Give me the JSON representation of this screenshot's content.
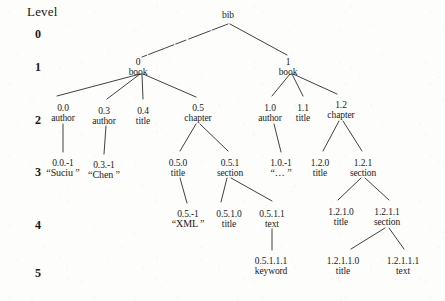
{
  "figure": {
    "level_axis_title": "Level",
    "level_numbers": [
      "0",
      "1",
      "2",
      "3",
      "4",
      "5"
    ]
  },
  "nodes": [
    {
      "key": "bib",
      "id": "",
      "label": "bib",
      "level": 0,
      "x": 228,
      "y": 10
    },
    {
      "key": "0",
      "id": "0",
      "label": "book",
      "level": 1,
      "x": 138,
      "y": 57
    },
    {
      "key": "1",
      "id": "1",
      "label": "book",
      "level": 1,
      "x": 288,
      "y": 57
    },
    {
      "key": "0.0",
      "id": "0.0",
      "label": "author",
      "level": 2,
      "x": 63,
      "y": 103
    },
    {
      "key": "0.3",
      "id": "0.3",
      "label": "author",
      "level": 2,
      "x": 104,
      "y": 106
    },
    {
      "key": "0.4",
      "id": "0.4",
      "label": "title",
      "level": 2,
      "x": 143,
      "y": 106
    },
    {
      "key": "0.5",
      "id": "0.5",
      "label": "chapter",
      "level": 2,
      "x": 198,
      "y": 103
    },
    {
      "key": "1.0",
      "id": "1.0",
      "label": "author",
      "level": 2,
      "x": 270,
      "y": 103
    },
    {
      "key": "1.1",
      "id": "1.1",
      "label": "title",
      "level": 2,
      "x": 303,
      "y": 103
    },
    {
      "key": "1.2",
      "id": "1.2",
      "label": "chapter",
      "level": 2,
      "x": 341,
      "y": 100
    },
    {
      "key": "0.0.-1",
      "id": "0.0.-1",
      "label": "“Suciu ”",
      "level": 3,
      "x": 63,
      "y": 158
    },
    {
      "key": "0.3.-1",
      "id": "0.3.-1",
      "label": "“Chen ”",
      "level": 3,
      "x": 104,
      "y": 160
    },
    {
      "key": "0.5.0",
      "id": "0.5.0",
      "label": "title",
      "level": 3,
      "x": 178,
      "y": 158
    },
    {
      "key": "0.5.1",
      "id": "0.5.1",
      "label": "section",
      "level": 3,
      "x": 230,
      "y": 158
    },
    {
      "key": "1.0.-1",
      "id": "1.0.-1",
      "label": "“… ”",
      "level": 3,
      "x": 281,
      "y": 158
    },
    {
      "key": "1.2.0",
      "id": "1.2.0",
      "label": "title",
      "level": 3,
      "x": 320,
      "y": 158
    },
    {
      "key": "1.2.1",
      "id": "1.2.1",
      "label": "section",
      "level": 3,
      "x": 363,
      "y": 158
    },
    {
      "key": "0.5.-1",
      "id": "0.5.-1",
      "label": "“XML ”",
      "level": 4,
      "x": 188,
      "y": 209
    },
    {
      "key": "0.5.1.0",
      "id": "0.5.1.0",
      "label": "title",
      "level": 4,
      "x": 229,
      "y": 209
    },
    {
      "key": "0.5.1.1",
      "id": "0.5.1.1",
      "label": "text",
      "level": 4,
      "x": 272,
      "y": 209
    },
    {
      "key": "1.2.1.0",
      "id": "1.2.1.0",
      "label": "title",
      "level": 4,
      "x": 341,
      "y": 207
    },
    {
      "key": "1.2.1.1",
      "id": "1.2.1.1",
      "label": "section",
      "level": 4,
      "x": 387,
      "y": 207
    },
    {
      "key": "0.5.1.1.1",
      "id": "0.5.1.1.1",
      "label": "keyword",
      "level": 5,
      "x": 271,
      "y": 256
    },
    {
      "key": "1.2.1.1.0",
      "id": "1.2.1.1.0",
      "label": "title",
      "level": 5,
      "x": 343,
      "y": 256
    },
    {
      "key": "1.2.1.1.1",
      "id": "1.2.1.1.1",
      "label": "text",
      "level": 5,
      "x": 403,
      "y": 256
    }
  ],
  "edges": [
    {
      "from": "bib",
      "to": "0",
      "x1": 228,
      "y1": 24,
      "x2": 142,
      "y2": 57,
      "style": "broken"
    },
    {
      "from": "bib",
      "to": "1",
      "x1": 230,
      "y1": 24,
      "x2": 287,
      "y2": 55,
      "style": "solid"
    },
    {
      "from": "0",
      "to": "0.0",
      "x1": 140,
      "y1": 74,
      "x2": 57,
      "y2": 96,
      "style": "solid"
    },
    {
      "from": "0",
      "to": "0.3",
      "x1": 140,
      "y1": 74,
      "x2": 107,
      "y2": 99,
      "style": "solid"
    },
    {
      "from": "0",
      "to": "0.4",
      "x1": 142,
      "y1": 74,
      "x2": 143,
      "y2": 99,
      "style": "solid"
    },
    {
      "from": "0",
      "to": "0.5",
      "x1": 143,
      "y1": 74,
      "x2": 196,
      "y2": 97,
      "style": "solid"
    },
    {
      "from": "1",
      "to": "1.0",
      "x1": 290,
      "y1": 74,
      "x2": 272,
      "y2": 96,
      "style": "solid"
    },
    {
      "from": "1",
      "to": "1.1",
      "x1": 292,
      "y1": 74,
      "x2": 303,
      "y2": 96,
      "style": "solid"
    },
    {
      "from": "1",
      "to": "1.2",
      "x1": 293,
      "y1": 74,
      "x2": 337,
      "y2": 94,
      "style": "solid"
    },
    {
      "from": "0.0",
      "to": "0.0.-1",
      "x1": 63,
      "y1": 124,
      "x2": 63,
      "y2": 152,
      "style": "solid"
    },
    {
      "from": "0.3",
      "to": "0.3.-1",
      "x1": 106,
      "y1": 126,
      "x2": 104,
      "y2": 154,
      "style": "solid"
    },
    {
      "from": "0.5",
      "to": "0.5.0",
      "x1": 196,
      "y1": 124,
      "x2": 180,
      "y2": 151,
      "style": "solid"
    },
    {
      "from": "0.5",
      "to": "0.5.1",
      "x1": 200,
      "y1": 124,
      "x2": 228,
      "y2": 151,
      "style": "solid"
    },
    {
      "from": "1.0",
      "to": "1.0.-1",
      "x1": 274,
      "y1": 124,
      "x2": 281,
      "y2": 152,
      "style": "solid"
    },
    {
      "from": "1.2",
      "to": "1.2.0",
      "x1": 339,
      "y1": 121,
      "x2": 323,
      "y2": 151,
      "style": "solid"
    },
    {
      "from": "1.2",
      "to": "1.2.1",
      "x1": 343,
      "y1": 121,
      "x2": 362,
      "y2": 151,
      "style": "solid"
    },
    {
      "from": "0.5.0",
      "to": "0.5.-1",
      "x1": 180,
      "y1": 178,
      "x2": 187,
      "y2": 203,
      "style": "solid"
    },
    {
      "from": "0.5.1",
      "to": "0.5.1.0",
      "x1": 227,
      "y1": 178,
      "x2": 221,
      "y2": 202,
      "style": "solid"
    },
    {
      "from": "0.5.1",
      "to": "0.5.1.1",
      "x1": 231,
      "y1": 178,
      "x2": 272,
      "y2": 201,
      "style": "solid"
    },
    {
      "from": "1.2.1",
      "to": "1.2.1.0",
      "x1": 361,
      "y1": 178,
      "x2": 338,
      "y2": 200,
      "style": "solid"
    },
    {
      "from": "1.2.1",
      "to": "1.2.1.1",
      "x1": 365,
      "y1": 178,
      "x2": 389,
      "y2": 200,
      "style": "solid"
    },
    {
      "from": "0.5.1.1",
      "to": "0.5.1.1.1",
      "x1": 272,
      "y1": 229,
      "x2": 272,
      "y2": 250,
      "style": "solid"
    },
    {
      "from": "1.2.1.1",
      "to": "1.2.1.1.0",
      "x1": 385,
      "y1": 228,
      "x2": 351,
      "y2": 249,
      "style": "solid"
    },
    {
      "from": "1.2.1.1",
      "to": "1.2.1.1.1",
      "x1": 389,
      "y1": 228,
      "x2": 404,
      "y2": 249,
      "style": "solid"
    }
  ],
  "style": {
    "ink": "#2b2b2b",
    "paper": "#fdfdfc"
  }
}
